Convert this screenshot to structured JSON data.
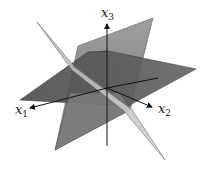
{
  "figure": {
    "axes": {
      "x1": {
        "label": "x",
        "subscript": "1"
      },
      "x2": {
        "label": "x",
        "subscript": "2"
      },
      "x3": {
        "label": "x",
        "subscript": "3"
      }
    },
    "colors": {
      "dark_plane": "#5a5a5a",
      "mid_plane": "#8a8a8a",
      "light_plane": "#c4c4c4",
      "axis": "#111111",
      "background": "#ffffff"
    }
  }
}
